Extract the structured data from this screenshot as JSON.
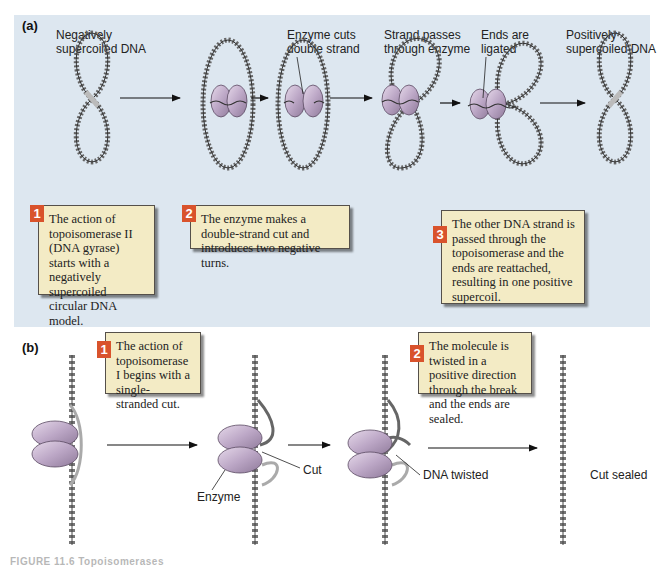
{
  "panel_a": {
    "label": "(a)",
    "stage_labels": {
      "negative": "Negatively\nsupercoiled DNA",
      "cut": "Enzyme cuts\ndouble strand",
      "passes": "Strand passes\nthrough enzyme",
      "ligated": "Ends are\nligated",
      "positive": "Positively\nsupercoiled DNA"
    },
    "steps": [
      {
        "number": "1",
        "text": "The action of topoisomerase II (DNA gyrase) starts with a negatively supercoiled circular DNA model."
      },
      {
        "number": "2",
        "text": "The enzyme makes a double-strand cut and introduces two negative turns."
      },
      {
        "number": "3",
        "text": "The other DNA strand is passed through the topoisomerase and the ends are reattached, resulting in one positive supercoil."
      }
    ]
  },
  "panel_b": {
    "label": "(b)",
    "annotations": {
      "enzyme": "Enzyme",
      "cut": "Cut",
      "twisted": "DNA twisted",
      "sealed": "Cut sealed"
    },
    "steps": [
      {
        "number": "1",
        "text": "The action of topoisomerase I begins with a single-stranded cut."
      },
      {
        "number": "2",
        "text": "The molecule is twisted in a positive direction through the break and the ends are sealed."
      }
    ]
  },
  "colors": {
    "panel_bg": "#dde7f0",
    "step_box_bg": "#f3ebc5",
    "step_number_bg": "#d9532c",
    "enzyme_fill": "#b8a3c2",
    "dna_dark": "#555555",
    "dna_light": "#a8a8a8"
  },
  "caption": "FIGURE 11.6  Topoisomerases"
}
